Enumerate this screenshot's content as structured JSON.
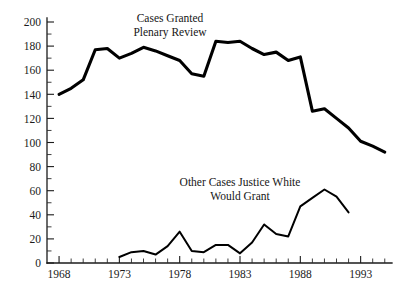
{
  "chart_data": {
    "type": "line",
    "title": "",
    "subtitle": "",
    "xlabel": "",
    "ylabel": "",
    "xlim": [
      1967,
      1995
    ],
    "ylim": [
      0,
      200
    ],
    "grid": false,
    "legend_position": "inline-annotation",
    "y_ticks": [
      0,
      20,
      40,
      60,
      80,
      100,
      120,
      140,
      160,
      180,
      200
    ],
    "y_tick_labels": [
      "0",
      "20",
      "40",
      "60",
      "80",
      "100",
      "120",
      "140",
      "160",
      "180",
      "200"
    ],
    "y_minor_tick_step": 10,
    "x_ticks": [
      1968,
      1973,
      1978,
      1983,
      1988,
      1993
    ],
    "x_tick_labels": [
      "1968",
      "1973",
      "1978",
      "1983",
      "1988",
      "1993"
    ],
    "x_minor_tick_step": 1,
    "series": [
      {
        "name": "Cases Granted Plenary Review",
        "color": "#000000",
        "annotation_lines": [
          "Cases Granted",
          "Plenary Review"
        ],
        "x": [
          1968,
          1969,
          1970,
          1971,
          1972,
          1973,
          1974,
          1975,
          1976,
          1977,
          1978,
          1979,
          1980,
          1981,
          1982,
          1983,
          1984,
          1985,
          1986,
          1987,
          1988,
          1989,
          1990,
          1991,
          1992,
          1993,
          1994,
          1995
        ],
        "values": [
          140,
          145,
          152,
          177,
          178,
          170,
          174,
          179,
          176,
          172,
          168,
          157,
          155,
          184,
          183,
          184,
          178,
          173,
          175,
          168,
          171,
          126,
          128,
          120,
          112,
          101,
          97,
          92
        ]
      },
      {
        "name": "Other Cases Justice White Would Grant",
        "color": "#1a1a1a",
        "annotation_lines": [
          "Other Cases Justice White",
          "Would Grant"
        ],
        "x": [
          1973,
          1974,
          1975,
          1976,
          1977,
          1978,
          1979,
          1980,
          1981,
          1982,
          1983,
          1984,
          1985,
          1986,
          1987,
          1988,
          1989,
          1990,
          1991,
          1992
        ],
        "values": [
          5,
          9,
          10,
          7,
          14,
          26,
          10,
          9,
          15,
          15,
          8,
          17,
          32,
          24,
          22,
          47,
          54,
          61,
          55,
          42
        ]
      }
    ],
    "annotations": [
      {
        "name": "cases-granted-label",
        "lines": [
          "Cases Granted",
          "Plenary Review"
        ],
        "x_px": 170,
        "y_px": 22
      },
      {
        "name": "justice-white-label",
        "lines": [
          "Other Cases Justice White",
          "Would Grant"
        ],
        "x_px": 240,
        "y_px": 186
      }
    ]
  }
}
